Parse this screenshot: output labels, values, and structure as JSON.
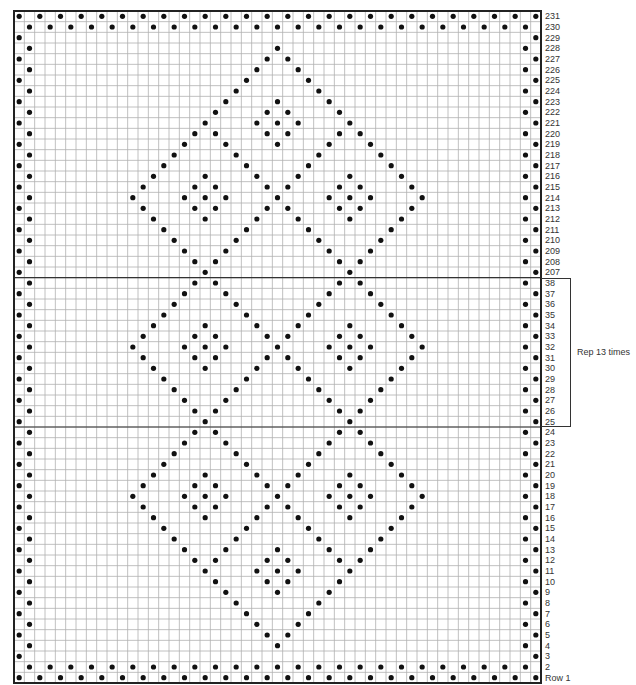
{
  "chart_data": {
    "type": "table",
    "title": "",
    "columns": 51,
    "grid_color": "#b0b0b0",
    "border_color": "#222222",
    "dot_color": "#111111",
    "repeat_note": "Rep 13 times",
    "repeat_rows": [
      38,
      25
    ],
    "separator_after_rows": [
      "207",
      "25"
    ],
    "rows": [
      {
        "label": "231",
        "dots": "full_even"
      },
      {
        "label": "230",
        "dots": "full_odd"
      },
      {
        "label": "229",
        "dots": []
      },
      {
        "label": "228",
        "dots": [
          25
        ]
      },
      {
        "label": "227",
        "dots": [
          24,
          26
        ]
      },
      {
        "label": "226",
        "dots": [
          23,
          27
        ]
      },
      {
        "label": "225",
        "dots": [
          22,
          28
        ]
      },
      {
        "label": "224",
        "dots": [
          21,
          29
        ]
      },
      {
        "label": "223",
        "dots": [
          20,
          25,
          30
        ]
      },
      {
        "label": "222",
        "dots": [
          19,
          24,
          26,
          31
        ]
      },
      {
        "label": "221",
        "dots": [
          18,
          23,
          25,
          27,
          32
        ]
      },
      {
        "label": "220",
        "dots": [
          17,
          19,
          24,
          26,
          31,
          33
        ]
      },
      {
        "label": "219",
        "dots": [
          16,
          20,
          25,
          30,
          34
        ]
      },
      {
        "label": "218",
        "dots": [
          15,
          21,
          29,
          35
        ]
      },
      {
        "label": "217",
        "dots": [
          14,
          22,
          28,
          36
        ]
      },
      {
        "label": "216",
        "dots": [
          13,
          18,
          23,
          27,
          32,
          37
        ]
      },
      {
        "label": "215",
        "dots": [
          12,
          17,
          19,
          24,
          26,
          31,
          33,
          38
        ]
      },
      {
        "label": "214",
        "dots": [
          11,
          16,
          18,
          20,
          25,
          30,
          32,
          34,
          39
        ]
      },
      {
        "label": "213",
        "dots": [
          12,
          17,
          19,
          24,
          26,
          31,
          33,
          38
        ]
      },
      {
        "label": "212",
        "dots": [
          13,
          18,
          23,
          27,
          32,
          37
        ]
      },
      {
        "label": "211",
        "dots": [
          14,
          22,
          28,
          36
        ]
      },
      {
        "label": "210",
        "dots": [
          15,
          21,
          29,
          35
        ]
      },
      {
        "label": "209",
        "dots": [
          16,
          20,
          30,
          34
        ]
      },
      {
        "label": "208",
        "dots": [
          17,
          19,
          31,
          33
        ]
      },
      {
        "label": "207",
        "dots": [
          18,
          32
        ]
      },
      {
        "label": "38",
        "dots": [
          17,
          19,
          31,
          33
        ]
      },
      {
        "label": "37",
        "dots": [
          16,
          20,
          30,
          34
        ]
      },
      {
        "label": "36",
        "dots": [
          15,
          21,
          29,
          35
        ]
      },
      {
        "label": "35",
        "dots": [
          14,
          22,
          28,
          36
        ]
      },
      {
        "label": "34",
        "dots": [
          13,
          18,
          23,
          27,
          32,
          37
        ]
      },
      {
        "label": "33",
        "dots": [
          12,
          17,
          19,
          24,
          26,
          31,
          33,
          38
        ]
      },
      {
        "label": "32",
        "dots": [
          11,
          16,
          18,
          20,
          25,
          30,
          32,
          34,
          39
        ]
      },
      {
        "label": "31",
        "dots": [
          12,
          17,
          19,
          24,
          26,
          31,
          33,
          38
        ]
      },
      {
        "label": "30",
        "dots": [
          13,
          18,
          23,
          27,
          32,
          37
        ]
      },
      {
        "label": "29",
        "dots": [
          14,
          22,
          28,
          36
        ]
      },
      {
        "label": "28",
        "dots": [
          15,
          21,
          29,
          35
        ]
      },
      {
        "label": "27",
        "dots": [
          16,
          20,
          30,
          34
        ]
      },
      {
        "label": "26",
        "dots": [
          17,
          19,
          31,
          33
        ]
      },
      {
        "label": "25",
        "dots": [
          18,
          32
        ]
      },
      {
        "label": "24",
        "dots": [
          17,
          19,
          31,
          33
        ]
      },
      {
        "label": "23",
        "dots": [
          16,
          20,
          30,
          34
        ]
      },
      {
        "label": "22",
        "dots": [
          15,
          21,
          29,
          35
        ]
      },
      {
        "label": "21",
        "dots": [
          14,
          22,
          28,
          36
        ]
      },
      {
        "label": "20",
        "dots": [
          13,
          18,
          23,
          27,
          32,
          37
        ]
      },
      {
        "label": "19",
        "dots": [
          12,
          17,
          19,
          24,
          26,
          31,
          33,
          38
        ]
      },
      {
        "label": "18",
        "dots": [
          11,
          16,
          18,
          20,
          25,
          30,
          32,
          34,
          39
        ]
      },
      {
        "label": "17",
        "dots": [
          12,
          17,
          19,
          24,
          26,
          31,
          33,
          38
        ]
      },
      {
        "label": "16",
        "dots": [
          13,
          18,
          23,
          27,
          32,
          37
        ]
      },
      {
        "label": "15",
        "dots": [
          14,
          22,
          28,
          36
        ]
      },
      {
        "label": "14",
        "dots": [
          15,
          21,
          29,
          35
        ]
      },
      {
        "label": "13",
        "dots": [
          16,
          20,
          25,
          30,
          34
        ]
      },
      {
        "label": "12",
        "dots": [
          17,
          19,
          24,
          26,
          31,
          33
        ]
      },
      {
        "label": "11",
        "dots": [
          18,
          23,
          25,
          27,
          32
        ]
      },
      {
        "label": "10",
        "dots": [
          19,
          24,
          26,
          31
        ]
      },
      {
        "label": "9",
        "dots": [
          20,
          25,
          30
        ]
      },
      {
        "label": "8",
        "dots": [
          21,
          29
        ]
      },
      {
        "label": "7",
        "dots": [
          22,
          28
        ]
      },
      {
        "label": "6",
        "dots": [
          23,
          27
        ]
      },
      {
        "label": "5",
        "dots": [
          24,
          26
        ]
      },
      {
        "label": "4",
        "dots": [
          25
        ]
      },
      {
        "label": "3",
        "dots": []
      },
      {
        "label": "2",
        "dots": "full_odd"
      },
      {
        "label": "Row 1",
        "dots": "full_even"
      }
    ],
    "edge_rule": "Odd-numbered rows: dots at columns 0 and 50; even-numbered rows: dots at columns 1 and 49 (in addition to listed interior dots)."
  },
  "labels": {
    "repeat": "Rep 13 times"
  }
}
